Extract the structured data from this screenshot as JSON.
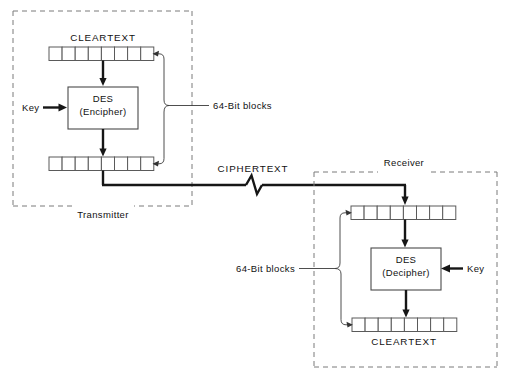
{
  "figure": {
    "background_color": "#ffffff",
    "line_color": "#161616",
    "dashed_box_color": "#7a7a7a"
  },
  "transmitter": {
    "boundary_label": "Transmitter",
    "input_register_label": "CLEARTEXT",
    "input_register_cells": 8,
    "output_register_cells": 8,
    "cipher_box": {
      "line1": "DES",
      "line2": "(Encipher)"
    },
    "key_label": "Key",
    "block_size_label": "64-Bit blocks"
  },
  "receiver": {
    "boundary_label": "Receiver",
    "output_register_label": "CLEARTEXT",
    "input_register_cells": 8,
    "output_register_cells": 8,
    "cipher_box": {
      "line1": "DES",
      "line2": "(Decipher)"
    },
    "key_label": "Key",
    "block_size_label": "64-Bit blocks"
  },
  "channel": {
    "label": "CIPHERTEXT",
    "break_symbol": "zigzag"
  }
}
